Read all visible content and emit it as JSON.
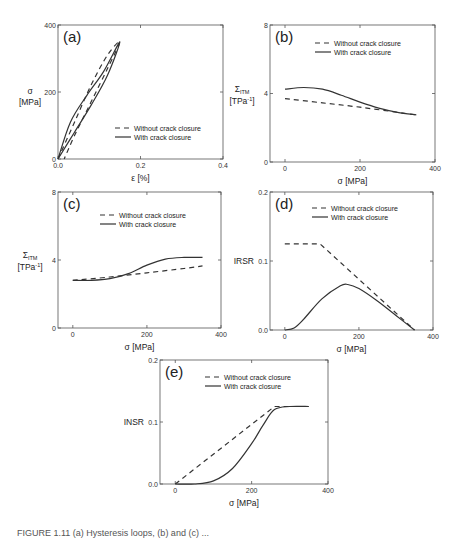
{
  "legend": {
    "without": "Without crack closure",
    "with": "With crack closure"
  },
  "chart_data": [
    {
      "id": "a",
      "type": "line",
      "panel_label": "(a)",
      "xlabel": "ε [%]",
      "ylabel": "σ [MPa]",
      "xlim": [
        0,
        0.4
      ],
      "ylim": [
        0,
        400
      ],
      "xticks": [
        "0.0",
        "0.2",
        "0.4"
      ],
      "yticks": [
        "0",
        "200",
        "400"
      ],
      "legend_position": "lower right",
      "series": [
        {
          "name": "Without crack closure",
          "style": "dashed",
          "x": [
            0.0,
            0.04,
            0.08,
            0.12,
            0.15,
            0.12,
            0.08,
            0.04,
            0.015
          ],
          "y": [
            0,
            110,
            220,
            310,
            350,
            270,
            170,
            70,
            0
          ]
        },
        {
          "name": "With crack closure",
          "style": "solid",
          "x": [
            0.0,
            0.03,
            0.07,
            0.11,
            0.15,
            0.12,
            0.08,
            0.04,
            0.0
          ],
          "y": [
            0,
            110,
            190,
            260,
            350,
            250,
            160,
            80,
            0
          ]
        }
      ]
    },
    {
      "id": "b",
      "type": "line",
      "panel_label": "(b)",
      "xlabel": "σ [MPa]",
      "ylabel": "Σ_ITM [TPa⁻¹]",
      "ylabel_main": "Σ",
      "ylabel_sub": "ITM",
      "ylabel_unit": "[TPa",
      "ylabel_unit_sup": "-1",
      "ylabel_unit_end": "]",
      "xlim": [
        -40,
        400
      ],
      "ylim": [
        0,
        8
      ],
      "xticks": [
        "0",
        "200",
        "400"
      ],
      "yticks": [
        "0",
        "4",
        "8"
      ],
      "legend_position": "upper right",
      "series": [
        {
          "name": "Without crack closure",
          "style": "dashed",
          "x": [
            0,
            100,
            200,
            300,
            350
          ],
          "y": [
            3.7,
            3.45,
            3.2,
            2.9,
            2.75
          ]
        },
        {
          "name": "With crack closure",
          "style": "solid",
          "x": [
            0,
            50,
            100,
            150,
            200,
            250,
            300,
            350
          ],
          "y": [
            4.25,
            4.35,
            4.25,
            3.9,
            3.5,
            3.15,
            2.9,
            2.75
          ]
        }
      ]
    },
    {
      "id": "c",
      "type": "line",
      "panel_label": "(c)",
      "xlabel": "σ [MPa]",
      "ylabel": "Σ_ITM [TPa⁻¹]",
      "ylabel_main": "Σ",
      "ylabel_sub": "ITM",
      "ylabel_unit": "[TPa",
      "ylabel_unit_sup": "-1",
      "ylabel_unit_end": "]",
      "xlim": [
        -40,
        400
      ],
      "ylim": [
        0,
        8
      ],
      "xticks": [
        "0",
        "200",
        "400"
      ],
      "yticks": [
        "0",
        "4",
        "8"
      ],
      "legend_position": "upper center",
      "series": [
        {
          "name": "Without crack closure",
          "style": "dashed",
          "x": [
            0,
            100,
            200,
            300,
            350
          ],
          "y": [
            2.8,
            3.0,
            3.25,
            3.5,
            3.65
          ]
        },
        {
          "name": "With crack closure",
          "style": "solid",
          "x": [
            0,
            50,
            100,
            150,
            200,
            250,
            300,
            350
          ],
          "y": [
            2.8,
            2.8,
            2.9,
            3.2,
            3.7,
            4.05,
            4.15,
            4.15
          ]
        }
      ]
    },
    {
      "id": "d",
      "type": "line",
      "panel_label": "(d)",
      "xlabel": "σ [MPa]",
      "ylabel": "IRSR",
      "xlim": [
        -40,
        400
      ],
      "ylim": [
        0,
        0.2
      ],
      "xticks": [
        "0",
        "200",
        "400"
      ],
      "yticks": [
        "0.0",
        "0.1",
        "0.2"
      ],
      "legend_position": "upper right",
      "series": [
        {
          "name": "Without crack closure",
          "style": "dashed",
          "x": [
            0,
            95,
            350
          ],
          "y": [
            0.125,
            0.125,
            0.0
          ]
        },
        {
          "name": "With crack closure",
          "style": "solid",
          "x": [
            0,
            25,
            50,
            100,
            150,
            170,
            200,
            250,
            300,
            350
          ],
          "y": [
            0.0,
            0.003,
            0.015,
            0.045,
            0.064,
            0.066,
            0.06,
            0.042,
            0.021,
            0.0
          ]
        }
      ]
    },
    {
      "id": "e",
      "type": "line",
      "panel_label": "(e)",
      "xlabel": "σ [MPa]",
      "ylabel": "INSR",
      "xlim": [
        -40,
        400
      ],
      "ylim": [
        0,
        0.2
      ],
      "xticks": [
        "0",
        "200",
        "400"
      ],
      "yticks": [
        "0.0",
        "0.1",
        "0.2"
      ],
      "legend_position": "upper right",
      "series": [
        {
          "name": "Without crack closure",
          "style": "dashed",
          "x": [
            0,
            260,
            350
          ],
          "y": [
            0.0,
            0.125,
            0.125
          ]
        },
        {
          "name": "With crack closure",
          "style": "solid",
          "x": [
            0,
            50,
            100,
            150,
            200,
            230,
            260,
            300,
            350
          ],
          "y": [
            0.0,
            0.0,
            0.005,
            0.025,
            0.065,
            0.095,
            0.12,
            0.125,
            0.125
          ]
        }
      ]
    }
  ],
  "caption_fragment": "FIGURE 1.11  (a) Hysteresis loops, (b) and (c) ..."
}
